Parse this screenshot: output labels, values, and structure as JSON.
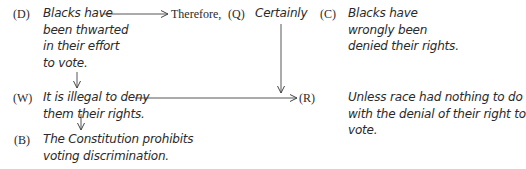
{
  "nodes": {
    "D": {
      "label": "(D)",
      "lines": [
        "Blacks have",
        "been thwarted",
        "in their effort",
        "to vote."
      ]
    },
    "therefore": {
      "text": "Therefore,"
    },
    "Q": {
      "label": "(Q)",
      "text": "Certainly"
    },
    "C": {
      "label": "(C)",
      "lines": [
        "Blacks have",
        "wrongly been",
        "denied their rights."
      ]
    },
    "W": {
      "label": "(W)",
      "lines": [
        "It is illegal to deny",
        "them their rights."
      ]
    },
    "R": {
      "label": "(R)",
      "lines": [
        "Unless race had nothing to do",
        "with the denial of their right to",
        "vote."
      ]
    },
    "B": {
      "label": "(B)",
      "lines": [
        "The Constitution prohibits",
        "voting discrimination."
      ]
    }
  },
  "arrows": [
    {
      "from": "D",
      "to": "therefore",
      "direction": "right"
    },
    {
      "from": "D",
      "to": "W",
      "direction": "down"
    },
    {
      "from": "W",
      "to": "R",
      "direction": "right"
    },
    {
      "from": "W",
      "to": "B",
      "direction": "down"
    },
    {
      "from": "Q",
      "to": "R",
      "direction": "down"
    }
  ],
  "colors": {
    "text": "#2a2a2a",
    "line": "#444444"
  }
}
